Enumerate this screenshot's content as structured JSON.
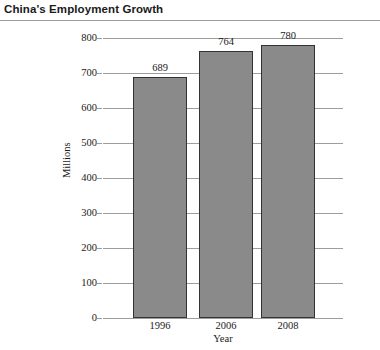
{
  "title": "China's Employment Growth",
  "chart_data": {
    "type": "bar",
    "title": "China's Employment Growth",
    "categories": [
      "1996",
      "2006",
      "2008"
    ],
    "values": [
      689,
      764,
      780
    ],
    "value_labels": [
      "689",
      "764",
      "780"
    ],
    "xlabel": "Year",
    "ylabel": "Millions",
    "ylim": [
      0,
      800
    ],
    "yticks": [
      0,
      100,
      200,
      300,
      400,
      500,
      600,
      700,
      800
    ],
    "ytick_labels": [
      "0",
      "100",
      "200",
      "300",
      "400",
      "500",
      "600",
      "700",
      "800"
    ],
    "grid": true,
    "legend": false,
    "bar_color": "#8a8a8a",
    "bar_border_color": "#333333",
    "gridline_color": "#9d9d9d",
    "text_color": "#1a1a1a"
  }
}
